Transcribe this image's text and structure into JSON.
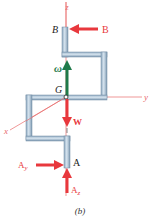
{
  "figure": {
    "caption": "(b)",
    "axes": {
      "z": "z",
      "y": "y",
      "x": "x"
    },
    "points": {
      "B": "B",
      "G": "G",
      "A": "A"
    },
    "forces": {
      "B": "B",
      "W": "W",
      "Ay_main": "A",
      "Ay_sub": "y",
      "Az_main": "A",
      "Az_sub": "z"
    },
    "angular_velocity": "ω",
    "colors": {
      "force_red": "#e8383d",
      "omega_green": "#1f7a4a",
      "axis_red": "#e86a6a",
      "rod_fill": "#b9cfe0",
      "rod_edge": "#6f8aa3",
      "label_dark": "#222222"
    }
  }
}
